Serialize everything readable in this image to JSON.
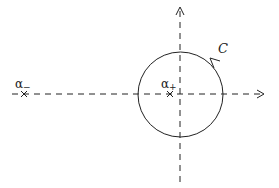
{
  "diagram": {
    "type": "complex-plane-contour",
    "colors": {
      "stroke": "#222222",
      "background": "#ffffff"
    },
    "axes": {
      "horizontal": {
        "style": "dashed",
        "direction": "right-arrow"
      },
      "vertical": {
        "style": "dashed",
        "direction": "up-arrow"
      }
    },
    "contour": {
      "label": "C",
      "shape": "circle",
      "orientation": "counterclockwise"
    },
    "points": [
      {
        "id": "alpha-minus",
        "symbol": "α",
        "subscript": "−",
        "marker": "×"
      },
      {
        "id": "alpha-plus",
        "symbol": "α",
        "subscript": "+",
        "marker": "×"
      }
    ]
  }
}
